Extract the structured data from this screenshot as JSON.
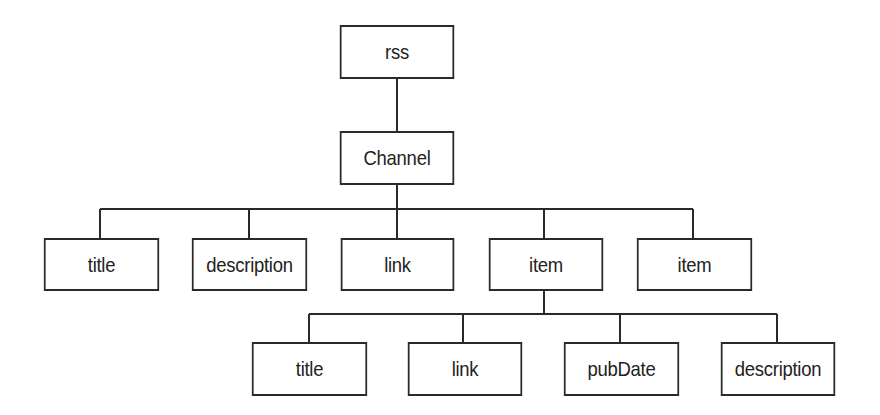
{
  "diagram": {
    "type": "tree",
    "root": {
      "label": "rss",
      "children": [
        {
          "label": "Channel",
          "children": [
            {
              "label": "title"
            },
            {
              "label": "description"
            },
            {
              "label": "link"
            },
            {
              "label": "item",
              "children": [
                {
                  "label": "title"
                },
                {
                  "label": "link"
                },
                {
                  "label": "pubDate"
                },
                {
                  "label": "description"
                }
              ]
            },
            {
              "label": "item"
            }
          ]
        }
      ]
    },
    "nodes": {
      "rss": "rss",
      "channel": "Channel",
      "channel_children": [
        "title",
        "description",
        "link",
        "item",
        "item"
      ],
      "item_children": [
        "title",
        "link",
        "pubDate",
        "description"
      ]
    },
    "colors": {
      "stroke": "#2a2a2a",
      "text": "#222222",
      "background": "#ffffff"
    }
  }
}
